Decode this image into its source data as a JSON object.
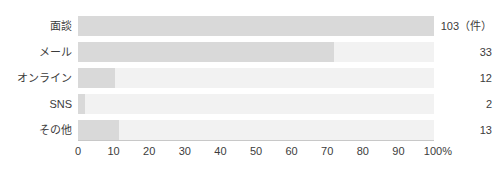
{
  "chart_data": {
    "type": "bar",
    "orientation": "horizontal",
    "title": "",
    "subtitle": "",
    "xlabel": "",
    "ylabel": "",
    "categories": [
      "面談",
      "メール",
      "オンライン",
      "SNS",
      "その他"
    ],
    "values": [
      103,
      33,
      12,
      2,
      13
    ],
    "value_labels": [
      "103（件）",
      "33",
      "12",
      "2",
      "13"
    ],
    "percentages": [
      100,
      72,
      10.5,
      2,
      11.5
    ],
    "unit_label": "（件）",
    "xlim": [
      0,
      100
    ],
    "xtick_labels": [
      "0",
      "10",
      "20",
      "30",
      "40",
      "50",
      "60",
      "70",
      "80",
      "90",
      "100%"
    ],
    "xtick_values": [
      0,
      10,
      20,
      30,
      40,
      50,
      60,
      70,
      80,
      90,
      100
    ],
    "grid": false,
    "legend": "none",
    "colors": {
      "bar": "#d9d9d9",
      "track": "#f2f2f2",
      "axis": "#c8c8c8",
      "text": "#3c3c3c",
      "background": "#ffffff"
    }
  }
}
